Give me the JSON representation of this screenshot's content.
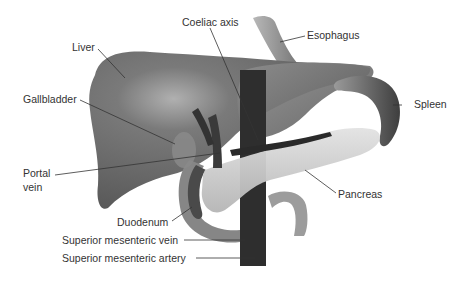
{
  "diagram": {
    "labels": [
      {
        "id": "liver",
        "text": "Liver"
      },
      {
        "id": "coeliac-axis",
        "text": "Coeliac axis"
      },
      {
        "id": "esophagus",
        "text": "Esophagus"
      },
      {
        "id": "gallbladder",
        "text": "Gallbladder"
      },
      {
        "id": "spleen",
        "text": "Spleen"
      },
      {
        "id": "portal-vein-1",
        "text": "Portal"
      },
      {
        "id": "portal-vein-2",
        "text": "vein"
      },
      {
        "id": "pancreas",
        "text": "Pancreas"
      },
      {
        "id": "duodenum",
        "text": "Duodenum"
      },
      {
        "id": "smv",
        "text": "Superior mesenteric vein"
      },
      {
        "id": "sma",
        "text": "Superior mesenteric artery"
      }
    ],
    "colors": {
      "liver": "#6a6a6a",
      "liver_highlight": "#a8a8a8",
      "stomach": "#7d7d7d",
      "spleen": "#5e5e5e",
      "pancreas": "#c9c9c9",
      "vessel_dark": "#2a2a2a",
      "esophagus": "#9a9a9a",
      "duodenum": "#8a8a8a",
      "leader_line": "#333333",
      "text": "#333333"
    }
  }
}
